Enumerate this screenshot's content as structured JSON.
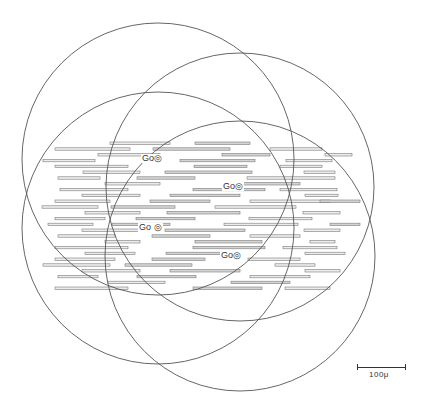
{
  "figure": {
    "circles": [
      {
        "cx": 158,
        "cy": 159,
        "r": 136
      },
      {
        "cx": 240,
        "cy": 187,
        "r": 134
      },
      {
        "cx": 158,
        "cy": 228,
        "r": 136
      },
      {
        "cx": 240,
        "cy": 256,
        "r": 135
      }
    ],
    "golgi_labels": [
      {
        "text": "Go",
        "mark": "◎",
        "x": 141,
        "y": 154
      },
      {
        "text": "Go",
        "mark": "◎",
        "x": 222,
        "y": 182
      },
      {
        "text": "Go",
        "mark": "◎",
        "x": 138,
        "y": 223
      },
      {
        "text": "Go",
        "mark": "◎",
        "x": 220,
        "y": 251
      }
    ],
    "scale_bar": {
      "label": "100μ",
      "length_px": 48
    }
  }
}
